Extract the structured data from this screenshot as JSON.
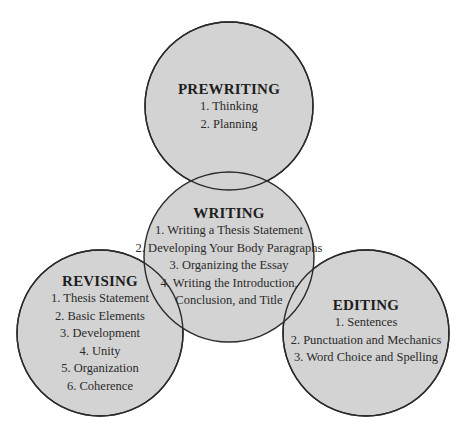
{
  "colors": {
    "circle_fill": "#d3d3d3",
    "circle_stroke": "#2a2a2a",
    "text": "#1e1e1e",
    "background": "#ffffff"
  },
  "circles": [
    {
      "id": "prewriting",
      "title": "PREWRITING",
      "items": [
        "1. Thinking",
        "2. Planning"
      ],
      "cx": 229,
      "cy": 106,
      "r": 84,
      "text_top": 80
    },
    {
      "id": "revising",
      "title": "REVISING",
      "items": [
        "1. Thesis Statement",
        "2. Basic Elements",
        "3. Development",
        "4. Unity",
        "5. Organization",
        "6. Coherence"
      ],
      "cx": 100,
      "cy": 333,
      "r": 83,
      "text_top": 272
    },
    {
      "id": "editing",
      "title": "EDITING",
      "items": [
        "1. Sentences",
        "2. Punctuation and Mechanics",
        "3. Word Choice and Spelling"
      ],
      "cx": 366,
      "cy": 333,
      "r": 83,
      "text_top": 296
    },
    {
      "id": "writing",
      "title": "WRITING",
      "items": [
        "1. Writing a Thesis Statement",
        "2. Developing Your Body Paragraphs",
        "3. Organizing the Essay",
        "4. Writing the Introduction,",
        "Conclusion, and Title"
      ],
      "cx": 229,
      "cy": 257,
      "r": 85,
      "text_top": 204
    }
  ]
}
